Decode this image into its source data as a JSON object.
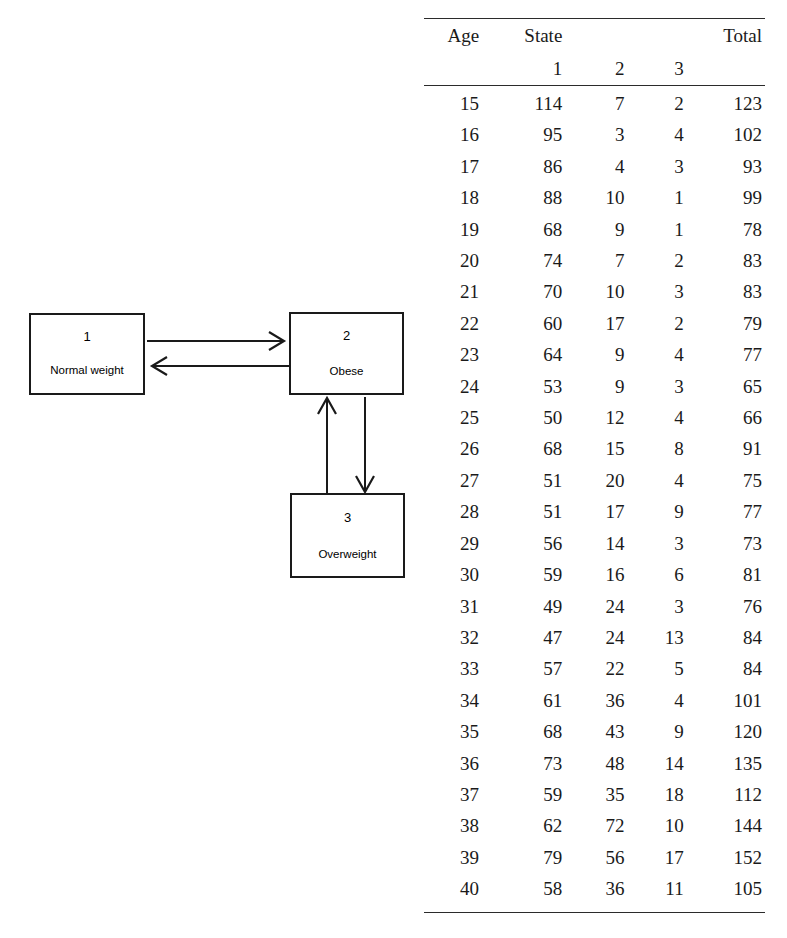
{
  "diagram": {
    "states": [
      {
        "id": "1",
        "label": "Normal weight"
      },
      {
        "id": "2",
        "label": "Obese"
      },
      {
        "id": "3",
        "label": "Overweight"
      }
    ],
    "transitions": [
      {
        "from": "1",
        "to": "2",
        "direction": "right"
      },
      {
        "from": "2",
        "to": "1",
        "direction": "left"
      },
      {
        "from": "3",
        "to": "2",
        "direction": "up"
      },
      {
        "from": "2",
        "to": "3",
        "direction": "down"
      }
    ],
    "stroke_color": "#1a1a1a"
  },
  "table": {
    "headers": {
      "age": "Age",
      "state": "State",
      "total": "Total",
      "state_levels": [
        "1",
        "2",
        "3"
      ]
    },
    "rows": [
      {
        "age": "15",
        "s1": "114",
        "s2": "7",
        "s3": "2",
        "total": "123"
      },
      {
        "age": "16",
        "s1": "95",
        "s2": "3",
        "s3": "4",
        "total": "102"
      },
      {
        "age": "17",
        "s1": "86",
        "s2": "4",
        "s3": "3",
        "total": "93"
      },
      {
        "age": "18",
        "s1": "88",
        "s2": "10",
        "s3": "1",
        "total": "99"
      },
      {
        "age": "19",
        "s1": "68",
        "s2": "9",
        "s3": "1",
        "total": "78"
      },
      {
        "age": "20",
        "s1": "74",
        "s2": "7",
        "s3": "2",
        "total": "83"
      },
      {
        "age": "21",
        "s1": "70",
        "s2": "10",
        "s3": "3",
        "total": "83"
      },
      {
        "age": "22",
        "s1": "60",
        "s2": "17",
        "s3": "2",
        "total": "79"
      },
      {
        "age": "23",
        "s1": "64",
        "s2": "9",
        "s3": "4",
        "total": "77"
      },
      {
        "age": "24",
        "s1": "53",
        "s2": "9",
        "s3": "3",
        "total": "65"
      },
      {
        "age": "25",
        "s1": "50",
        "s2": "12",
        "s3": "4",
        "total": "66"
      },
      {
        "age": "26",
        "s1": "68",
        "s2": "15",
        "s3": "8",
        "total": "91"
      },
      {
        "age": "27",
        "s1": "51",
        "s2": "20",
        "s3": "4",
        "total": "75"
      },
      {
        "age": "28",
        "s1": "51",
        "s2": "17",
        "s3": "9",
        "total": "77"
      },
      {
        "age": "29",
        "s1": "56",
        "s2": "14",
        "s3": "3",
        "total": "73"
      },
      {
        "age": "30",
        "s1": "59",
        "s2": "16",
        "s3": "6",
        "total": "81"
      },
      {
        "age": "31",
        "s1": "49",
        "s2": "24",
        "s3": "3",
        "total": "76"
      },
      {
        "age": "32",
        "s1": "47",
        "s2": "24",
        "s3": "13",
        "total": "84"
      },
      {
        "age": "33",
        "s1": "57",
        "s2": "22",
        "s3": "5",
        "total": "84"
      },
      {
        "age": "34",
        "s1": "61",
        "s2": "36",
        "s3": "4",
        "total": "101"
      },
      {
        "age": "35",
        "s1": "68",
        "s2": "43",
        "s3": "9",
        "total": "120"
      },
      {
        "age": "36",
        "s1": "73",
        "s2": "48",
        "s3": "14",
        "total": "135"
      },
      {
        "age": "37",
        "s1": "59",
        "s2": "35",
        "s3": "18",
        "total": "112"
      },
      {
        "age": "38",
        "s1": "62",
        "s2": "72",
        "s3": "10",
        "total": "144"
      },
      {
        "age": "39",
        "s1": "79",
        "s2": "56",
        "s3": "17",
        "total": "152"
      },
      {
        "age": "40",
        "s1": "58",
        "s2": "36",
        "s3": "11",
        "total": "105"
      }
    ]
  }
}
